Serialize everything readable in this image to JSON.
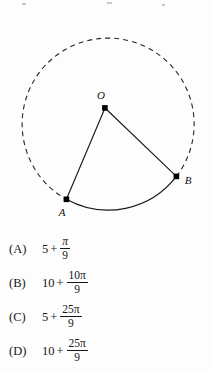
{
  "figure": {
    "type": "circle-with-sector",
    "center_label": "O",
    "point_a_label": "A",
    "point_b_label": "B",
    "circle": {
      "cx": 105,
      "cy": 108,
      "r": 86
    },
    "points": {
      "O": {
        "x": 105,
        "y": 108
      },
      "A": {
        "x": 66,
        "y": 199
      },
      "B": {
        "x": 176,
        "y": 176
      }
    },
    "arc_style_minor": "solid",
    "arc_style_major": "dashed",
    "radius_style": "solid",
    "stroke_color": "#1a1a1a",
    "dot_color": "#000000"
  },
  "choices": [
    {
      "tag": "(A)",
      "whole": "5",
      "operator": "+",
      "numerator": "π",
      "denominator": "9"
    },
    {
      "tag": "(B)",
      "whole": "10",
      "operator": "+",
      "numerator": "10π",
      "denominator": "9"
    },
    {
      "tag": "(C)",
      "whole": "5",
      "operator": "+",
      "numerator": "25π",
      "denominator": "9"
    },
    {
      "tag": "(D)",
      "whole": "10",
      "operator": "+",
      "numerator": "25π",
      "denominator": "9"
    }
  ]
}
